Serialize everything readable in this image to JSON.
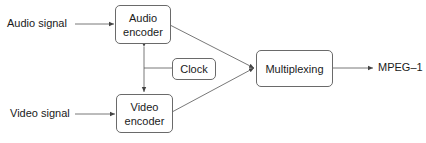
{
  "diagram": {
    "inputs": {
      "audio": "Audio signal",
      "video": "Video signal"
    },
    "blocks": {
      "audio_encoder": {
        "line1": "Audio",
        "line2": "encoder"
      },
      "video_encoder": {
        "line1": "Video",
        "line2": "encoder"
      },
      "clock": "Clock",
      "multiplexing": "Multiplexing"
    },
    "output": "MPEG–1",
    "colors": {
      "stroke": "#6a6a6a",
      "text": "#1a1a1a",
      "background": "#ffffff"
    }
  }
}
